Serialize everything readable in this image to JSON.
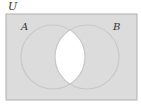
{
  "diagram": {
    "type": "venn",
    "universe_label": "U",
    "sets": [
      {
        "label": "A"
      },
      {
        "label": "B"
      }
    ],
    "shaded_region": "complement of A ∩ B",
    "colors": {
      "shade": "#dcdcdc",
      "unshaded": "#ffffff",
      "circle_stroke": "#c8c8c8",
      "border": "#b0b0b0"
    }
  }
}
